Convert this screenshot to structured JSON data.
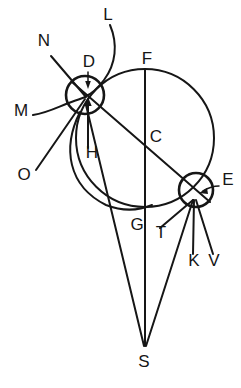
{
  "figure": {
    "type": "geometric-diagram",
    "width": 241,
    "height": 388,
    "background_color": "#ffffff",
    "ink_color": "#161616"
  },
  "labels": {
    "L": "L",
    "N": "N",
    "D": "D",
    "F": "F",
    "M": "M",
    "C": "C",
    "H": "H",
    "O": "O",
    "E": "E",
    "G": "G",
    "T": "T",
    "K": "K",
    "V": "V",
    "S": "S"
  },
  "label_positions": {
    "L": {
      "x": 108,
      "y": 20
    },
    "N": {
      "x": 44,
      "y": 46
    },
    "D": {
      "x": 89,
      "y": 67
    },
    "F": {
      "x": 147,
      "y": 64
    },
    "M": {
      "x": 21,
      "y": 116
    },
    "C": {
      "x": 156,
      "y": 142
    },
    "H": {
      "x": 92,
      "y": 158
    },
    "O": {
      "x": 24,
      "y": 180
    },
    "E": {
      "x": 228,
      "y": 185
    },
    "G": {
      "x": 137,
      "y": 230
    },
    "T": {
      "x": 161,
      "y": 238
    },
    "K": {
      "x": 194,
      "y": 266
    },
    "V": {
      "x": 214,
      "y": 266
    },
    "S": {
      "x": 144,
      "y": 367
    }
  },
  "geometry": {
    "main_circle": {
      "cx": 145,
      "cy": 138,
      "r": 69,
      "name": "large-circle",
      "center_label": "C"
    },
    "circle_D": {
      "cx": 85,
      "cy": 95,
      "r": 19,
      "name": "small-circle-D"
    },
    "circle_E": {
      "cx": 196,
      "cy": 190,
      "r": 17,
      "name": "small-circle-E"
    },
    "apex_S": {
      "x": 145,
      "y": 348
    },
    "vertical_diameter": {
      "x": 145,
      "y_top": 69,
      "y_bottom": 207,
      "endpoints": [
        "F",
        "G"
      ]
    },
    "oblique_diameter": {
      "from": "D",
      "to": "E",
      "through": "C"
    }
  },
  "rays": {
    "at_D": [
      "L",
      "N",
      "M",
      "O",
      "H"
    ],
    "at_E": [
      "T",
      "K",
      "V"
    ],
    "to_S": [
      "from-D",
      "from-E",
      "vertical-FG-extended"
    ]
  }
}
